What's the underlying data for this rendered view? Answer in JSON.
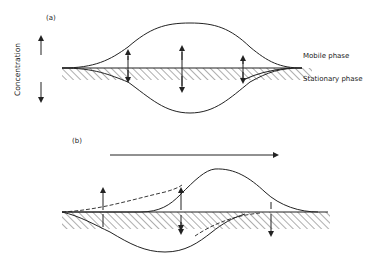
{
  "figure": {
    "y_axis_label": "Concentration",
    "panel_a": {
      "label": "(a)",
      "mobile_phase_label": "Mobile phase",
      "stationary_phase_label": "Stationary phase"
    },
    "panel_b": {
      "label": "(b)",
      "flow_direction": "right"
    },
    "colors": {
      "line": "#222222",
      "background": "#ffffff"
    }
  }
}
